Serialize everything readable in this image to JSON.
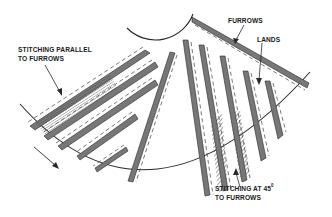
{
  "diagram": {
    "labels": {
      "stitching_parallel_line1": "STITCHING PARALLEL",
      "stitching_parallel_line2": "TO FURROWS",
      "furrows": "FURROWS",
      "lands": "LANDS",
      "stitching_45_line1": "STITCHING AT 45",
      "stitching_45_degree": "0",
      "stitching_45_line2": "TO FURROWS"
    },
    "elements": {
      "center_hub": "center-hub-arc",
      "outer_edge": "outer-disc-arc",
      "rotation_arrow": "rotation-direction-arrow"
    },
    "colors": {
      "ink": "#2a2a2a",
      "land_fill": "#8a8a8a",
      "background": "#ffffff"
    }
  }
}
